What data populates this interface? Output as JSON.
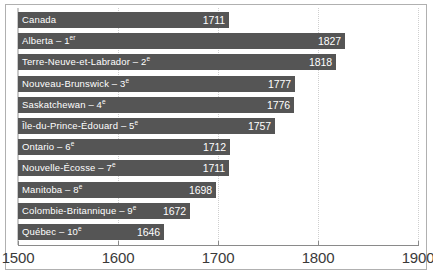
{
  "chart_data": {
    "type": "bar",
    "orientation": "horizontal",
    "title": "",
    "subtitle": "",
    "xlabel": "",
    "ylabel": "",
    "xlim": [
      1500,
      1900
    ],
    "xticks": [
      1500,
      1600,
      1700,
      1800,
      1900
    ],
    "xtick_labels": [
      "1500",
      "1600",
      "1700",
      "1800",
      "1900"
    ],
    "grid": true,
    "grid_axis": "x",
    "grid_style": "dotted",
    "legend": false,
    "categories": [
      "Canada",
      "Alberta – 1er",
      "Terre-Neuve-et-Labrador – 2e",
      "Nouveau-Brunswick – 3e",
      "Saskatchewan – 4e",
      "Île-du-Prince-Édouard – 5e",
      "Ontario – 6e",
      "Nouvelle-Écosse – 7e",
      "Manitoba – 8e",
      "Colombie-Britannique – 9e",
      "Québec – 10e"
    ],
    "values": [
      1711,
      1827,
      1818,
      1777,
      1776,
      1757,
      1712,
      1711,
      1698,
      1672,
      1646
    ],
    "data_labels": [
      "1711",
      "1827",
      "1818",
      "1777",
      "1776",
      "1757",
      "1712",
      "1711",
      "1698",
      "1672",
      "1646"
    ],
    "bar_color": "#555555",
    "label_color": "#ffffff",
    "background_color": "#ffffff",
    "frame_color": "#b0b0b0"
  },
  "bars": [
    {
      "name": "Canada",
      "ordinal": "",
      "ordinal_sup": "",
      "value": 1711,
      "value_label": "1711"
    },
    {
      "name": "Alberta",
      "ordinal": "1",
      "ordinal_sup": "er",
      "value": 1827,
      "value_label": "1827"
    },
    {
      "name": "Terre-Neuve-et-Labrador",
      "ordinal": "2",
      "ordinal_sup": "e",
      "value": 1818,
      "value_label": "1818"
    },
    {
      "name": "Nouveau-Brunswick",
      "ordinal": "3",
      "ordinal_sup": "e",
      "value": 1777,
      "value_label": "1777"
    },
    {
      "name": "Saskatchewan",
      "ordinal": "4",
      "ordinal_sup": "e",
      "value": 1776,
      "value_label": "1776"
    },
    {
      "name": "Île-du-Prince-Édouard",
      "ordinal": "5",
      "ordinal_sup": "e",
      "value": 1757,
      "value_label": "1757"
    },
    {
      "name": "Ontario",
      "ordinal": "6",
      "ordinal_sup": "e",
      "value": 1712,
      "value_label": "1712"
    },
    {
      "name": "Nouvelle-Écosse",
      "ordinal": "7",
      "ordinal_sup": "e",
      "value": 1711,
      "value_label": "1711"
    },
    {
      "name": "Manitoba",
      "ordinal": "8",
      "ordinal_sup": "e",
      "value": 1698,
      "value_label": "1698"
    },
    {
      "name": "Colombie-Britannique",
      "ordinal": "9",
      "ordinal_sup": "e",
      "value": 1672,
      "value_label": "1672"
    },
    {
      "name": "Québec",
      "ordinal": "10",
      "ordinal_sup": "e",
      "value": 1646,
      "value_label": "1646"
    }
  ],
  "axis": {
    "ticks": [
      {
        "value": 1500,
        "label": "1500"
      },
      {
        "value": 1600,
        "label": "1600"
      },
      {
        "value": 1700,
        "label": "1700"
      },
      {
        "value": 1800,
        "label": "1800"
      },
      {
        "value": 1900,
        "label": "1900"
      }
    ]
  }
}
